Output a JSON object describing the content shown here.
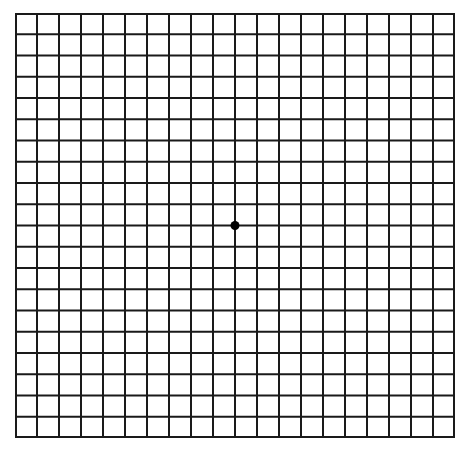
{
  "diagram": {
    "type": "amsler-grid",
    "columns": 20,
    "rows": 20,
    "line_color": "#1a1a1a",
    "background_color": "#ffffff",
    "center_dot_color": "#000000"
  }
}
